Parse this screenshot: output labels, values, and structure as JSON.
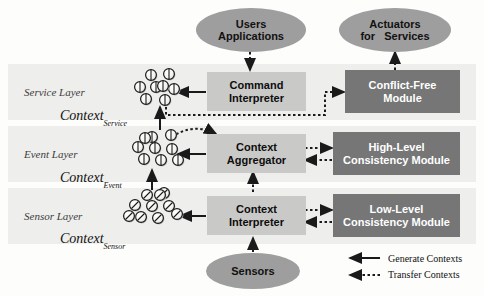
{
  "diagram": {
    "colors": {
      "band": "#eeeeec",
      "ellipse_fill": "#9e9e9e",
      "box_light_fill": "#c9c9c7",
      "box_dark_fill": "#767676",
      "box_dark_text": "#ffffff",
      "stroke": "#1a1a1a"
    }
  },
  "external_nodes": [
    {
      "id": "users-applications",
      "lines": [
        "Users",
        "Applications"
      ],
      "shape": "ellipse"
    },
    {
      "id": "actuators-for-services",
      "lines": [
        "Actuators",
        "for   Services"
      ],
      "shape": "ellipse"
    },
    {
      "id": "sensors",
      "lines": [
        "Sensors"
      ],
      "shape": "ellipse"
    }
  ],
  "layers": [
    {
      "id": "service-layer",
      "name": "Service Layer",
      "context_label": "Context",
      "context_subscript": "Service",
      "context_cluster_style": "vertical-split",
      "context_cluster_count": 8,
      "process": {
        "id": "command-interpreter",
        "lines": [
          "Command",
          "Interpreter"
        ],
        "style": "light"
      },
      "module": {
        "id": "conflict-free-module",
        "lines": [
          "Conflict-Free",
          "Module"
        ],
        "style": "dark"
      }
    },
    {
      "id": "event-layer",
      "name": "Event Layer",
      "context_label": "Context",
      "context_subscript": "Event",
      "context_cluster_style": "vertical-split",
      "context_cluster_count": 9,
      "process": {
        "id": "context-aggregator",
        "lines": [
          "Context",
          "Aggregator"
        ],
        "style": "light"
      },
      "module": {
        "id": "high-level-consistency-module",
        "lines": [
          "High-Level",
          "Consistency Module"
        ],
        "style": "dark"
      }
    },
    {
      "id": "sensor-layer",
      "name": "Sensor Layer",
      "context_label": "Context",
      "context_subscript": "Sensor",
      "context_cluster_style": "diagonal-split",
      "context_cluster_count": 10,
      "process": {
        "id": "context-interpreter",
        "lines": [
          "Context",
          "Interpreter"
        ],
        "style": "light"
      },
      "module": {
        "id": "low-level-consistency-module",
        "lines": [
          "Low-Level",
          "Consistency Module"
        ],
        "style": "dark"
      }
    }
  ],
  "legend": {
    "items": [
      {
        "id": "generate-contexts",
        "label": "Generate Contexts",
        "line": "solid"
      },
      {
        "id": "transfer-contexts",
        "label": "Transfer Contexts",
        "line": "dotted"
      }
    ]
  }
}
